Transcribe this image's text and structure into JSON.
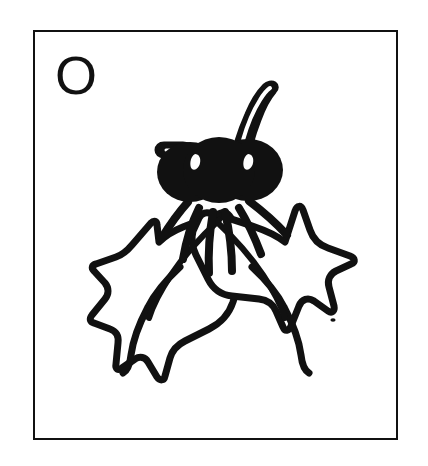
{
  "card": {
    "background_color": "#ffffff",
    "border_color": "#111111",
    "ink_color": "#111111",
    "letter": "O",
    "letter_name": "letter-o"
  },
  "artwork": {
    "title": "holly sprig line drawing",
    "style": "black ink outline clip-art",
    "elements": [
      {
        "name": "berry-left",
        "type": "filled-circle",
        "fill": "#111111"
      },
      {
        "name": "berry-right",
        "type": "filled-circle",
        "fill": "#111111"
      },
      {
        "name": "berry-highlight-left",
        "type": "highlight-dot",
        "fill": "#ffffff"
      },
      {
        "name": "berry-highlight-right",
        "type": "highlight-dot",
        "fill": "#ffffff"
      },
      {
        "name": "long-stem",
        "type": "outlined-stem",
        "fill": "#111111"
      },
      {
        "name": "hooked-stem",
        "type": "outlined-stem",
        "fill": "#111111"
      },
      {
        "name": "leaf-left",
        "type": "outlined-leaf",
        "stroke": "#111111"
      },
      {
        "name": "leaf-right",
        "type": "outlined-leaf",
        "stroke": "#111111"
      },
      {
        "name": "leaf-vein-left",
        "type": "vein",
        "stroke": "#111111"
      },
      {
        "name": "leaf-vein-right",
        "type": "vein",
        "stroke": "#111111"
      },
      {
        "name": "ink-speck",
        "type": "dot",
        "fill": "#111111"
      }
    ]
  }
}
